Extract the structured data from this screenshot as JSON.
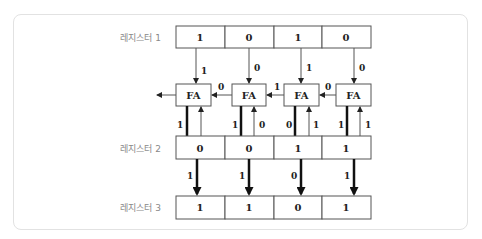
{
  "diagram": {
    "registers": [
      {
        "label": "레지스터 1",
        "bits": [
          "1",
          "0",
          "1",
          "0"
        ]
      },
      {
        "label": "레지스터 2",
        "bits": [
          "0",
          "0",
          "1",
          "1"
        ]
      },
      {
        "label": "레지스터 3",
        "bits": [
          "1",
          "1",
          "0",
          "1"
        ]
      }
    ],
    "fa_label": "FA",
    "reg1_to_fa": [
      "1",
      "0",
      "1",
      "0"
    ],
    "carries_between_fa": [
      "0",
      "1",
      "0"
    ],
    "fa_to_reg2_out": [
      "1",
      "1",
      "0",
      "1"
    ],
    "reg2_to_fa_in": [
      "1",
      "0",
      "1",
      "1"
    ],
    "reg2_to_reg3": [
      "1",
      "1",
      "0",
      "1"
    ]
  }
}
